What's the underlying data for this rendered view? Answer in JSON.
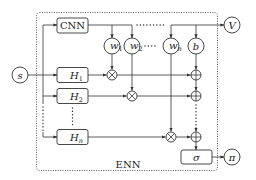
{
  "diagram": {
    "container_label": "ENN",
    "input": {
      "label": "s"
    },
    "cnn": {
      "label": "CNN"
    },
    "value_output": {
      "label": "V"
    },
    "weights": [
      {
        "label": "w",
        "sub": "1"
      },
      {
        "label": "w",
        "sub": "2"
      },
      {
        "label": "w",
        "sub": "n"
      }
    ],
    "bias": {
      "label": "b"
    },
    "heads": [
      {
        "label": "H",
        "sub": "1"
      },
      {
        "label": "H",
        "sub": "2"
      },
      {
        "label": "H",
        "sub": "n"
      }
    ],
    "multiply_symbol": "⊗",
    "add_symbol": "⊕",
    "activation": {
      "label": "σ"
    },
    "policy_output": {
      "label": "π"
    },
    "colors": {
      "stroke": "#333333",
      "background": "#ffffff"
    }
  }
}
